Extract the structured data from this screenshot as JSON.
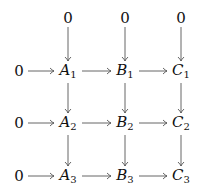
{
  "diagram": {
    "type": "commutative-diagram",
    "nodes": [
      {
        "id": "z_top_A",
        "label": "0",
        "x": 68,
        "y": 18
      },
      {
        "id": "z_top_B",
        "label": "0",
        "x": 125,
        "y": 18
      },
      {
        "id": "z_top_C",
        "label": "0",
        "x": 181,
        "y": 18
      },
      {
        "id": "z_row1",
        "label": "0",
        "x": 19,
        "y": 71
      },
      {
        "id": "A1",
        "letter": "A",
        "sub": "1",
        "x": 68,
        "y": 71
      },
      {
        "id": "B1",
        "letter": "B",
        "sub": "1",
        "x": 125,
        "y": 71
      },
      {
        "id": "C1",
        "letter": "C",
        "sub": "1",
        "x": 181,
        "y": 71
      },
      {
        "id": "z_row2",
        "label": "0",
        "x": 19,
        "y": 123
      },
      {
        "id": "A2",
        "letter": "A",
        "sub": "2",
        "x": 68,
        "y": 123
      },
      {
        "id": "B2",
        "letter": "B",
        "sub": "2",
        "x": 125,
        "y": 123
      },
      {
        "id": "C2",
        "letter": "C",
        "sub": "2",
        "x": 181,
        "y": 123
      },
      {
        "id": "z_row3",
        "label": "0",
        "x": 19,
        "y": 176
      },
      {
        "id": "A3",
        "letter": "A",
        "sub": "3",
        "x": 68,
        "y": 176
      },
      {
        "id": "B3",
        "letter": "B",
        "sub": "3",
        "x": 125,
        "y": 176
      },
      {
        "id": "C3",
        "letter": "C",
        "sub": "3",
        "x": 181,
        "y": 176
      }
    ],
    "edges": [
      {
        "from": "z_top_A",
        "to": "A1"
      },
      {
        "from": "z_top_B",
        "to": "B1"
      },
      {
        "from": "z_top_C",
        "to": "C1"
      },
      {
        "from": "z_row1",
        "to": "A1"
      },
      {
        "from": "A1",
        "to": "B1"
      },
      {
        "from": "B1",
        "to": "C1"
      },
      {
        "from": "A1",
        "to": "A2"
      },
      {
        "from": "B1",
        "to": "B2"
      },
      {
        "from": "C1",
        "to": "C2"
      },
      {
        "from": "z_row2",
        "to": "A2"
      },
      {
        "from": "A2",
        "to": "B2"
      },
      {
        "from": "B2",
        "to": "C2"
      },
      {
        "from": "A2",
        "to": "A3"
      },
      {
        "from": "B2",
        "to": "B3"
      },
      {
        "from": "C2",
        "to": "C3"
      },
      {
        "from": "z_row3",
        "to": "A3"
      },
      {
        "from": "A3",
        "to": "B3"
      },
      {
        "from": "B3",
        "to": "C3"
      }
    ],
    "colors": {
      "arrow": "#555555",
      "text": "#111111"
    }
  }
}
